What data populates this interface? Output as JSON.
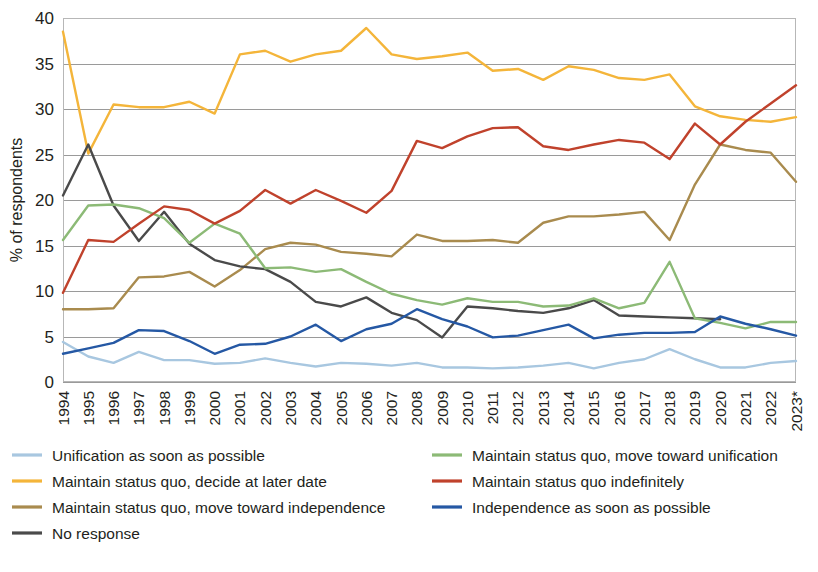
{
  "chart_data": {
    "type": "line",
    "title": "",
    "subtitle": "",
    "xlabel": "",
    "ylabel": "% of respondents",
    "ylim": [
      0,
      40
    ],
    "ytick_step": 5,
    "yticks": [
      "0",
      "5",
      "10",
      "15",
      "20",
      "25",
      "30",
      "35",
      "40"
    ],
    "grid": true,
    "legend_position": "bottom",
    "note": "2023 marked with asterisk",
    "categories": [
      "1994",
      "1995",
      "1996",
      "1997",
      "1998",
      "1999",
      "2000",
      "2001",
      "2002",
      "2003",
      "2004",
      "2005",
      "2006",
      "2007",
      "2008",
      "2009",
      "2010",
      "2011",
      "2012",
      "2013",
      "2014",
      "2015",
      "2016",
      "2017",
      "2018",
      "2019",
      "2020",
      "2021",
      "2022",
      "2023*"
    ],
    "series": [
      {
        "name": "Unification as soon as possible",
        "color": "#a8c7e0",
        "values": [
          4.4,
          2.8,
          2.1,
          3.3,
          2.4,
          2.4,
          2.0,
          2.1,
          2.6,
          2.1,
          1.7,
          2.1,
          2.0,
          1.8,
          2.1,
          1.6,
          1.6,
          1.5,
          1.6,
          1.8,
          2.1,
          1.5,
          2.1,
          2.5,
          3.6,
          2.5,
          1.6,
          1.6,
          2.1,
          2.3
        ]
      },
      {
        "name": "Maintain status quo, decide at later date",
        "color": "#f4b53a",
        "values": [
          38.5,
          25.1,
          30.5,
          30.2,
          30.2,
          30.8,
          29.5,
          36.0,
          36.4,
          35.2,
          36.0,
          36.4,
          38.9,
          36.0,
          35.5,
          35.8,
          36.2,
          34.2,
          34.4,
          33.2,
          34.7,
          34.3,
          33.4,
          33.2,
          33.8,
          30.3,
          29.2,
          28.8,
          28.6,
          29.1
        ]
      },
      {
        "name": "Maintain status quo, move toward independence",
        "color": "#a98b4e",
        "values": [
          8.0,
          8.0,
          8.1,
          11.5,
          11.6,
          12.1,
          10.5,
          12.3,
          14.6,
          15.3,
          15.1,
          14.3,
          14.1,
          13.8,
          16.2,
          15.5,
          15.5,
          15.6,
          15.3,
          17.5,
          18.2,
          18.2,
          18.4,
          18.7,
          15.6,
          21.7,
          26.1,
          25.5,
          25.2,
          22.0
        ]
      },
      {
        "name": "No response",
        "color": "#4a4a4a",
        "values": [
          20.5,
          26.1,
          19.4,
          15.5,
          18.7,
          15.2,
          13.4,
          12.7,
          12.4,
          11.0,
          8.8,
          8.3,
          9.3,
          7.6,
          6.8,
          4.9,
          8.3,
          8.1,
          7.8,
          7.6,
          8.1,
          9.0,
          7.3,
          7.2,
          7.1,
          7.0,
          6.9,
          null,
          null,
          null
        ]
      },
      {
        "name": "Maintain status quo, move toward unification",
        "color": "#8cba76",
        "values": [
          15.6,
          19.4,
          19.5,
          19.1,
          18.0,
          15.3,
          17.4,
          16.3,
          12.5,
          12.6,
          12.1,
          12.4,
          11.0,
          9.7,
          9.0,
          8.5,
          9.2,
          8.8,
          8.8,
          8.3,
          8.4,
          9.2,
          8.1,
          8.7,
          13.2,
          7.0,
          6.5,
          5.9,
          6.6,
          6.6
        ]
      },
      {
        "name": "Maintain status quo indefinitely",
        "color": "#c0422c",
        "values": [
          9.8,
          15.6,
          15.4,
          17.4,
          19.3,
          18.9,
          17.4,
          18.8,
          21.1,
          19.6,
          21.1,
          19.9,
          18.6,
          21.0,
          26.5,
          25.7,
          27.0,
          27.9,
          28.0,
          25.9,
          25.5,
          26.1,
          26.6,
          26.3,
          24.5,
          28.4,
          26.1,
          28.6,
          30.6,
          32.6
        ]
      },
      {
        "name": "Independence as soon as possible",
        "color": "#2558a4",
        "values": [
          3.1,
          3.7,
          4.3,
          5.7,
          5.6,
          4.5,
          3.1,
          4.1,
          4.2,
          5.0,
          6.3,
          4.5,
          5.8,
          6.4,
          8.0,
          6.9,
          6.1,
          4.9,
          5.1,
          5.7,
          6.3,
          4.8,
          5.2,
          5.4,
          5.4,
          5.5,
          7.2,
          6.4,
          5.8,
          5.1
        ]
      }
    ],
    "legend": [
      {
        "label": "Unification as soon as possible",
        "color": "#a8c7e0",
        "column": 1
      },
      {
        "label": "Maintain status quo, move toward unification",
        "color": "#8cba76",
        "column": 2
      },
      {
        "label": "Maintain status quo, decide at later date",
        "color": "#f4b53a",
        "column": 1
      },
      {
        "label": "Maintain status quo indefinitely",
        "color": "#c0422c",
        "column": 2
      },
      {
        "label": "Maintain status quo, move toward independence",
        "color": "#a98b4e",
        "column": 1
      },
      {
        "label": "Independence as soon as possible",
        "color": "#2558a4",
        "column": 2
      },
      {
        "label": "No response",
        "color": "#4a4a4a",
        "column": 1
      }
    ]
  }
}
